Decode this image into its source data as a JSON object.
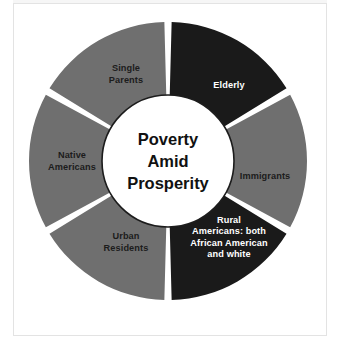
{
  "diagram": {
    "type": "donut-segments",
    "center": {
      "lines": [
        "Poverty",
        "Amid",
        "Prosperity"
      ],
      "fill": "#ffffff",
      "stroke": "#1c1c1c"
    },
    "colors": {
      "gray_segment": "#6f6f6f",
      "dark_segment": "#1a1a1a",
      "gap": "#ffffff",
      "page_background": "#ffffff",
      "frame_border": "#e3e3e3",
      "label_on_dark": "#ffffff",
      "label_on_light": "#1c1c1c"
    },
    "geometry": {
      "cx": 168,
      "cy": 161,
      "outer_radius": 139,
      "inner_radius": 66,
      "segment_count": 6,
      "segment_span_degrees": 60,
      "gap_degrees": 3,
      "start_angle_degrees": 0
    },
    "segments": [
      {
        "id": "elderly",
        "lines": [
          "Elderly"
        ],
        "tone": "dark",
        "label_x": 229,
        "label_y": 88
      },
      {
        "id": "immigrants",
        "lines": [
          "Immigrants"
        ],
        "tone": "gray",
        "label_x": 265,
        "label_y": 179
      },
      {
        "id": "rural-americans",
        "lines": [
          "Rural",
          "Americans: both",
          "African American",
          "and white"
        ],
        "tone": "dark",
        "label_x": 229,
        "label_y": 240
      },
      {
        "id": "urban-residents",
        "lines": [
          "Urban",
          "Residents"
        ],
        "tone": "gray",
        "label_x": 126,
        "label_y": 245
      },
      {
        "id": "native-americans",
        "lines": [
          "Native",
          "Americans"
        ],
        "tone": "gray",
        "label_x": 72,
        "label_y": 164
      },
      {
        "id": "single-parents",
        "lines": [
          "Single",
          "Parents"
        ],
        "tone": "gray",
        "label_x": 126,
        "label_y": 77
      }
    ]
  }
}
